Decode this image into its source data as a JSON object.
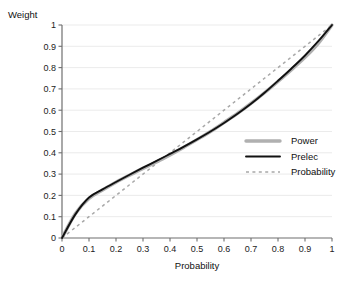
{
  "chart_data": {
    "type": "line",
    "title": "",
    "xlabel": "Probability",
    "ylabel": "Weight",
    "xlim": [
      0,
      1
    ],
    "ylim": [
      0,
      1
    ],
    "grid": "horizontal",
    "legend_position": "right-middle",
    "x_ticks": [
      "0",
      "0.1",
      "0.2",
      "0.3",
      "0.4",
      "0.5",
      "0.6",
      "0.7",
      "0.8",
      "0.9",
      "1"
    ],
    "y_ticks": [
      "0",
      "0.1",
      "0.2",
      "0.3",
      "0.4",
      "0.5",
      "0.6",
      "0.7",
      "0.8",
      "0.9",
      "1"
    ],
    "x": [
      0,
      0.05,
      0.1,
      0.15,
      0.2,
      0.25,
      0.3,
      0.35,
      0.4,
      0.45,
      0.5,
      0.55,
      0.6,
      0.65,
      0.7,
      0.75,
      0.8,
      0.85,
      0.9,
      0.95,
      1
    ],
    "series": [
      {
        "name": "Power",
        "color": "#b0b0b0",
        "style": "solid-thick",
        "values": [
          0,
          0.115,
          0.185,
          0.225,
          0.262,
          0.295,
          0.327,
          0.357,
          0.39,
          0.425,
          0.462,
          0.5,
          0.542,
          0.585,
          0.632,
          0.682,
          0.735,
          0.79,
          0.848,
          0.915,
          1
        ]
      },
      {
        "name": "Prelec",
        "color": "#111111",
        "style": "solid-thin",
        "values": [
          0,
          0.112,
          0.19,
          0.228,
          0.263,
          0.297,
          0.33,
          0.362,
          0.395,
          0.428,
          0.463,
          0.5,
          0.54,
          0.583,
          0.63,
          0.682,
          0.738,
          0.796,
          0.857,
          0.925,
          1
        ]
      },
      {
        "name": "Probability",
        "color": "#a8a8a8",
        "style": "dashed",
        "values": [
          0,
          0.05,
          0.1,
          0.15,
          0.2,
          0.25,
          0.3,
          0.35,
          0.4,
          0.45,
          0.5,
          0.55,
          0.6,
          0.65,
          0.7,
          0.75,
          0.8,
          0.85,
          0.9,
          0.95,
          1
        ]
      }
    ],
    "legend": [
      {
        "label": "Power",
        "swatch": "thick-gray-line"
      },
      {
        "label": "Prelec",
        "swatch": "thin-black-line"
      },
      {
        "label": "Probability",
        "swatch": "gray-dashed-line"
      }
    ]
  }
}
